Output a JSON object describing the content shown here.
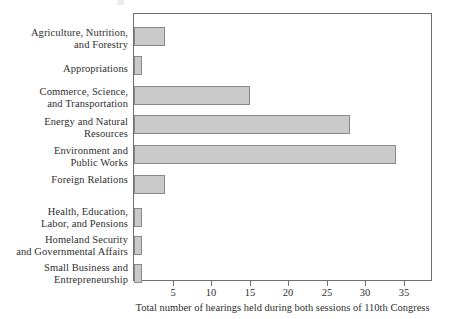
{
  "chart_data": {
    "type": "bar",
    "orientation": "horizontal",
    "title": "",
    "xlabel": "Total number of hearings held during both sessions of 110th Congress",
    "ylabel": "",
    "xlim": [
      0,
      38.5
    ],
    "xticks": [
      5,
      10,
      15,
      20,
      25,
      30,
      35
    ],
    "xtick_labels": [
      "5",
      "10",
      "15",
      "20",
      "25",
      "30",
      "35"
    ],
    "grid": false,
    "legend": null,
    "bar_color": "#cacaca",
    "bar_edge_color": "#8a8a8a",
    "frame_color": "#6f6f6f",
    "categories": [
      "Agriculture, Nutrition, and Forestry",
      "Appropriations",
      "Commerce, Science, and Transportation",
      "Energy and Natural Resources",
      "Environment and Public Works",
      "Foreign Relations",
      "Health, Education, Labor, and Pensions",
      "Homeland Security and Governmental Affairs",
      "Small Business and Entrepreneurship"
    ],
    "values": [
      4,
      1,
      15,
      28,
      34,
      4,
      1,
      1,
      1
    ]
  },
  "categories": [
    {
      "lines": [
        "Agriculture, Nutrition,",
        "and Forestry"
      ],
      "value": 4
    },
    {
      "lines": [
        "Appropriations"
      ],
      "value": 1
    },
    {
      "lines": [
        "Commerce, Science,",
        "and Transportation"
      ],
      "value": 15
    },
    {
      "lines": [
        "Energy and Natural",
        "Resources"
      ],
      "value": 28
    },
    {
      "lines": [
        "Environment and",
        "Public Works"
      ],
      "value": 34
    },
    {
      "lines": [
        "Foreign Relations"
      ],
      "value": 4
    },
    {
      "lines": [
        "Health, Education,",
        "Labor, and Pensions"
      ],
      "value": 1
    },
    {
      "lines": [
        "Homeland Security",
        "and Governmental Affairs"
      ],
      "value": 1
    },
    {
      "lines": [
        "Small Business and",
        "Entrepreneurship"
      ],
      "value": 1
    }
  ],
  "axis": {
    "x_title": "Total number of hearings held during both sessions of 110th Congress",
    "ticks": [
      {
        "value": 5,
        "label": "5"
      },
      {
        "value": 10,
        "label": "10"
      },
      {
        "value": 15,
        "label": "15"
      },
      {
        "value": 20,
        "label": "20"
      },
      {
        "value": 25,
        "label": "25"
      },
      {
        "value": 30,
        "label": "30"
      },
      {
        "value": 35,
        "label": "35"
      }
    ]
  }
}
